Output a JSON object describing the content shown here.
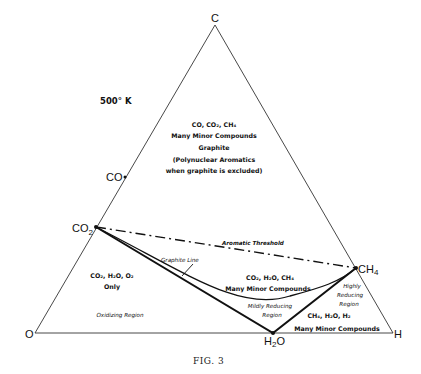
{
  "diagram": {
    "temperature": "500° K",
    "caption": "FIG. 3",
    "vertices": {
      "top": "C",
      "bottom_left": "O",
      "bottom_right": "H"
    },
    "points": {
      "co": "CO",
      "co2": "CO",
      "co2_sub": "2",
      "ch4": "CH",
      "ch4_sub": "4",
      "h2o_a": "H",
      "h2o_sub": "2",
      "h2o_b": "O"
    },
    "lines": {
      "aromatic_threshold": "Aromatic Threshold",
      "graphite_line": "Graphite Line"
    },
    "regions": {
      "top": {
        "line1": "CO, CO₂, CH₄",
        "line2": "Many Minor Compounds",
        "line3": "Graphite",
        "line4": "(Polynuclear Aromatics",
        "line5": "when graphite is excluded)"
      },
      "left": {
        "line1": "CO₂, H₂O, O₂",
        "line2": "Only",
        "label": "Oxidizing Region"
      },
      "middle": {
        "line1": "CO₂, H₂O, CH₄",
        "line2": "Many Minor Compounds"
      },
      "mildly_reducing": {
        "line1": "Mildly Reducing",
        "line2": "Region"
      },
      "highly_reducing": {
        "line1": "Highly",
        "line2": "Reducing",
        "line3": "Region"
      },
      "bottom_right": {
        "line1": "CH₄, H₂O, H₂",
        "line2": "Many Minor Compounds"
      }
    }
  }
}
